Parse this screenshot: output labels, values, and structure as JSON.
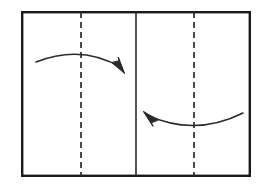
{
  "diagram": {
    "type": "origami-fold-instruction",
    "title": "",
    "canvas": {
      "width": 265,
      "height": 188,
      "background": "#ffffff"
    },
    "colors": {
      "paper_fill": "#ffffff",
      "paper_border": "#1a1a1a",
      "fold_line": "#2b2b2b",
      "crease_line": "#2b2b2b",
      "arrow": "#2b2b2b"
    },
    "paper": {
      "label": "paper-sheet",
      "x": 21,
      "y": 11,
      "width": 230,
      "height": 166,
      "border_width": 2.4
    },
    "center_line": {
      "label": "center-fold-line",
      "style": "solid",
      "x": 136,
      "y1": 12,
      "y2": 176,
      "stroke_width": 1.6
    },
    "crease_lines": [
      {
        "label": "left-crease-line",
        "style": "dashed",
        "x": 81,
        "y1": 12,
        "y2": 176,
        "stroke_width": 1.7,
        "dash": "6 4"
      },
      {
        "label": "right-crease-line",
        "style": "dashed",
        "x": 194,
        "y1": 12,
        "y2": 176,
        "stroke_width": 1.7,
        "dash": "6 4"
      }
    ],
    "arrows": [
      {
        "label": "top-fold-arrow",
        "direction": "left-to-right",
        "curve": "arc-over",
        "path": "M 36 62 Q 82 44 122 68",
        "head": "M 122 68 L 113 63 L 124 73 L 119 59 Z",
        "start": {
          "x": 36,
          "y": 62
        },
        "end": {
          "x": 124,
          "y": 72
        },
        "stroke_width": 1.6
      },
      {
        "label": "bottom-fold-arrow",
        "direction": "right-to-left",
        "curve": "arc-under",
        "path": "M 243 113 Q 195 137 147 115",
        "head": "M 147 115 L 157 119 L 144 112 L 151 125 Z",
        "start": {
          "x": 243,
          "y": 113
        },
        "end": {
          "x": 144,
          "y": 112
        },
        "stroke_width": 1.6
      }
    ]
  }
}
